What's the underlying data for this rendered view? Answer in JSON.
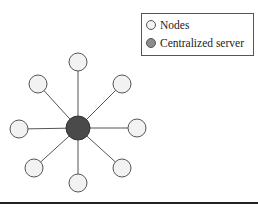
{
  "legend": {
    "items": [
      {
        "label": "Nodes",
        "type": "node"
      },
      {
        "label": "Centralized server",
        "type": "server"
      }
    ]
  },
  "colors": {
    "node_fill": "#f2f2f2",
    "node_stroke": "#555555",
    "server_fill": "#4a4a4a",
    "edge": "#555555",
    "legend_server_fill": "#8c8c8c"
  },
  "topology": {
    "center": {
      "label": "Centralized server",
      "x": 78,
      "y": 128,
      "r": 12
    },
    "nodes": [
      {
        "label": "Node",
        "x": 78,
        "y": 62
      },
      {
        "label": "Node",
        "x": 122,
        "y": 84
      },
      {
        "label": "Node",
        "x": 137,
        "y": 128
      },
      {
        "label": "Node",
        "x": 122,
        "y": 168
      },
      {
        "label": "Node",
        "x": 78,
        "y": 183
      },
      {
        "label": "Node",
        "x": 34,
        "y": 168
      },
      {
        "label": "Node",
        "x": 19,
        "y": 129
      },
      {
        "label": "Node",
        "x": 38,
        "y": 84
      }
    ],
    "node_r": 9
  }
}
